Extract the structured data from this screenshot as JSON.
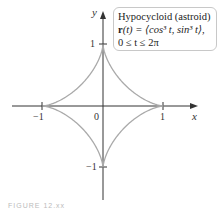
{
  "chart_data": {
    "type": "line",
    "title": "Hypocycloid (astroid)",
    "series": [
      {
        "name": "r(t) = ⟨cos³ t, sin³ t⟩",
        "parametric": {
          "x": "cos^3 t",
          "y": "sin^3 t",
          "t_range": [
            0,
            6.2832
          ]
        },
        "color": "#aaaaaa"
      }
    ],
    "xlabel": "x",
    "ylabel": "y",
    "xticks": [
      -1,
      0,
      1
    ],
    "yticks": [
      -1,
      1
    ],
    "xlim": [
      -1.5,
      1.5
    ],
    "ylim": [
      -1.6,
      1.6
    ],
    "grid": false,
    "legend_position": "top-right"
  },
  "labels": {
    "x_axis": "x",
    "y_axis": "y",
    "tick_x_neg1": "−1",
    "tick_x_0": "0",
    "tick_x_1": "1",
    "tick_y_1": "1",
    "tick_y_neg1": "−1"
  },
  "legend": {
    "line1": "Hypocycloid (astroid)",
    "line2_bold": "r",
    "line2_rest": "(t) = ⟨cos³ t, sin³ t⟩,",
    "line3": "0 ≤ t ≤ 2π"
  },
  "caption": "FIGURE 12.xx"
}
